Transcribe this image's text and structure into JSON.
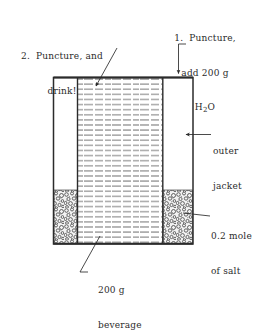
{
  "figure": {
    "type": "labeled-cross-section",
    "background_color": "#ffffff",
    "ink_color": "#2b2b2b"
  },
  "annotations": {
    "step1": {
      "line1": "1.  Puncture,",
      "line2": "add 200 g",
      "line3_prefix": "H",
      "line3_sub": "2",
      "line3_suffix": "O",
      "points_to": "outer-jacket-top"
    },
    "step2": {
      "line1": "2.  Puncture, and",
      "line2": "drink!",
      "points_to": "inner-beverage-chamber"
    },
    "outer_jacket": {
      "line1": "outer",
      "line2": "jacket",
      "points_to": "outer-jacket-cavity"
    },
    "salt": {
      "line1": "0.2 mole",
      "line2": "of salt",
      "points_to": "salt-bed-right"
    },
    "beverage": {
      "line1": "200 g",
      "line2": "beverage",
      "points_to": "inner-beverage-chamber"
    }
  },
  "geometry": {
    "outer_left": 53,
    "outer_right": 193,
    "outer_top": 77,
    "outer_bottom": 244,
    "inner_left": 77,
    "inner_right": 163,
    "salt_top": 190
  },
  "contents": {
    "beverage_mass": "200 g",
    "water_mass": "200 g",
    "salt_amount": "0.2 mole",
    "water_formula": "H2O"
  }
}
